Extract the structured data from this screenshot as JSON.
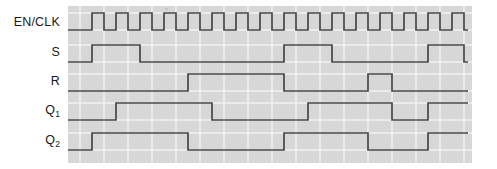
{
  "figure": {
    "type": "digital-timing-diagram",
    "background_color": "#ffffff",
    "grid_fill_color": "#d7d7d7",
    "grid_line_color": "#f2f2f2",
    "trace_color": "#474747"
  },
  "labels": {
    "en_clk": "EN/CLK",
    "s": "S",
    "r": "R",
    "q1_base": "Q",
    "q1_sub": "1",
    "q2_base": "Q",
    "q2_sub": "2"
  },
  "chart_data": {
    "type": "line",
    "title": "",
    "xlabel": "",
    "ylabel": "",
    "grid": true,
    "legend_position": "left-axis-labels",
    "plot_area_px": {
      "x": 68,
      "y": 6,
      "width": 404,
      "height": 157
    },
    "time_axis": {
      "unit": "clock period",
      "period_px": 24,
      "origin_px": 80,
      "periods_visible": 16
    },
    "rows": [
      {
        "name": "EN/CLK",
        "label": "EN/CLK",
        "row_center_y": 22,
        "high_y": 13,
        "low_y": 30,
        "initial_level": 0,
        "description": "free-running clock, 16 pulses",
        "transitions_px": [
          92,
          104,
          116,
          128,
          140,
          152,
          164,
          176,
          188,
          200,
          212,
          224,
          236,
          248,
          260,
          272,
          284,
          296,
          308,
          320,
          332,
          344,
          356,
          368,
          380,
          392,
          404,
          416,
          428,
          440,
          452,
          464
        ]
      },
      {
        "name": "S",
        "label": "S",
        "row_center_y": 52,
        "high_y": 45,
        "low_y": 62,
        "initial_level": 0,
        "description": "set input: high during periods 1-2, again 10-12, again 16",
        "transitions_px": [
          92,
          140,
          284,
          332,
          428,
          464
        ]
      },
      {
        "name": "R",
        "label": "R",
        "row_center_y": 81,
        "high_y": 74,
        "low_y": 91,
        "initial_level": 0,
        "description": "reset input: high during periods 5-9, pulse at 13-14",
        "transitions_px": [
          188,
          284,
          368,
          392
        ]
      },
      {
        "name": "Q1",
        "label": "Q1",
        "row_center_y": 111,
        "high_y": 103,
        "low_y": 120,
        "initial_level": 0,
        "description": "first flip-flop output",
        "transitions_px": [
          116,
          212,
          308,
          392,
          428
        ]
      },
      {
        "name": "Q2",
        "label": "Q2",
        "row_center_y": 141,
        "high_y": 133,
        "low_y": 150,
        "initial_level": 0,
        "description": "second flip-flop output",
        "transitions_px": [
          92,
          188,
          284,
          368,
          428
        ]
      }
    ]
  }
}
